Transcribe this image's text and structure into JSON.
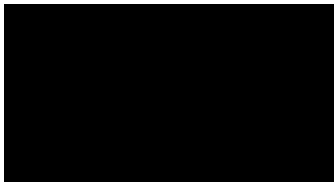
{
  "image": {
    "kind": "grid-lattice-photo",
    "description": "Dark rectangular lattice of black tiles separated by faint light seams",
    "width": 336,
    "height": 183,
    "page_background": "#ffffff",
    "plate_background": "#050505",
    "tile_color": "#000000",
    "seam_color": "#9a9a9a"
  },
  "plate": {
    "x": 4,
    "y": 4,
    "width": 330,
    "height": 178
  },
  "grid": {
    "columns": 8,
    "rows": 4,
    "column_edges": [
      0,
      41,
      83,
      124,
      166,
      207,
      249,
      290,
      330
    ],
    "row_edges": [
      0,
      45,
      86,
      127,
      178
    ],
    "seam_thickness": 1,
    "node_gap": 9,
    "cell_inset": 1
  },
  "seams": {
    "horizontal_y": [
      4,
      45,
      86,
      127,
      172
    ],
    "vertical_x": [
      0,
      41,
      83,
      124,
      166,
      207,
      249,
      290,
      329
    ]
  },
  "labels": {
    "title": "",
    "caption": ""
  }
}
